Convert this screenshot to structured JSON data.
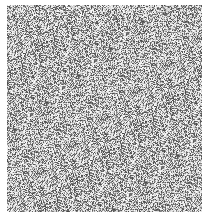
{
  "image": {
    "description": "grayscale random noise texture",
    "background": "#ffffff",
    "noise": {
      "x": 7,
      "y": 5,
      "width": 195,
      "height": 207,
      "dark": "#5a5a5a",
      "light": "#ffffff",
      "density": 0.5
    }
  }
}
